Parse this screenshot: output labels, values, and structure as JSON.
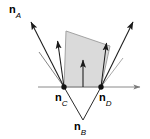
{
  "figure": {
    "type": "vector-geometry-diagram",
    "background_color": "#ffffff",
    "stroke_color": "#000000",
    "polygon_fill": "#d9d9d9",
    "polygon_stroke": "#808080",
    "axis_color": "#808080",
    "labels": [
      {
        "id": "nA",
        "symbol": "n",
        "subscript": "A",
        "x": 9,
        "y": 4
      },
      {
        "id": "nC",
        "symbol": "n",
        "subscript": "C",
        "x": 55,
        "y": 92
      },
      {
        "id": "nD",
        "symbol": "n",
        "subscript": "D",
        "x": 99,
        "y": 92
      },
      {
        "id": "nB",
        "symbol": "n",
        "subscript": "B",
        "x": 74,
        "y": 121
      }
    ],
    "points": [
      {
        "id": "point-nC",
        "x": 64,
        "y": 87
      },
      {
        "id": "point-nD",
        "x": 101,
        "y": 87
      }
    ],
    "axis": {
      "id": "horizontal-axis",
      "x1": 38,
      "y1": 87,
      "x2": 144,
      "y2": 87
    },
    "polygon": {
      "id": "shaded-quadrilateral",
      "points": "66,31 110,46 101,87 64,87"
    },
    "vectors": [
      {
        "id": "vector-nA-long",
        "x1": 64,
        "y1": 87,
        "x2": 29,
        "y2": 19
      },
      {
        "id": "vector-nC-short",
        "x1": 64,
        "y1": 87,
        "x2": 57,
        "y2": 38
      },
      {
        "id": "vector-nB-vertical",
        "x1": 83,
        "y1": 87,
        "x2": 83,
        "y2": 57
      },
      {
        "id": "vector-nD-short",
        "x1": 101,
        "y1": 87,
        "x2": 107,
        "y2": 40
      },
      {
        "id": "vector-nD-long",
        "x1": 101,
        "y1": 87,
        "x2": 135,
        "y2": 19
      }
    ],
    "construction_lines": [
      {
        "id": "line-nC-to-nB",
        "x1": 64,
        "y1": 87,
        "x2": 83,
        "y2": 120
      },
      {
        "id": "line-nD-to-nB",
        "x1": 101,
        "y1": 87,
        "x2": 83,
        "y2": 120
      },
      {
        "id": "line-nC-upper-left",
        "x1": 64,
        "y1": 87,
        "x2": 40,
        "y2": 53
      },
      {
        "id": "line-nD-upper-right",
        "x1": 101,
        "y1": 87,
        "x2": 122,
        "y2": 57
      }
    ]
  }
}
